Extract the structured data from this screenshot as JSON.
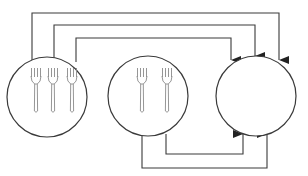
{
  "diagram": {
    "colors": {
      "stroke": "#3a3a3a",
      "fork": "#8a8a8a",
      "background": "#ffffff"
    },
    "nodes": [
      {
        "id": "plate-left",
        "label": "",
        "fork_count": 3,
        "cx": 47,
        "cy": 97,
        "r": 40
      },
      {
        "id": "plate-middle",
        "label": "",
        "fork_count": 2,
        "cx": 148,
        "cy": 96,
        "r": 40
      },
      {
        "id": "plate-right",
        "label": "",
        "fork_count": 0,
        "cx": 256,
        "cy": 96,
        "r": 40
      }
    ],
    "edges": [
      {
        "from": "plate-left",
        "to": "plate-right",
        "route": "top-outer"
      },
      {
        "from": "plate-left",
        "to": "plate-right",
        "route": "top-middle"
      },
      {
        "from": "plate-left",
        "to": "plate-right",
        "route": "top-inner"
      },
      {
        "from": "plate-middle",
        "to": "plate-right",
        "route": "bottom-inner"
      },
      {
        "from": "plate-middle",
        "to": "plate-right",
        "route": "bottom-outer"
      }
    ]
  }
}
